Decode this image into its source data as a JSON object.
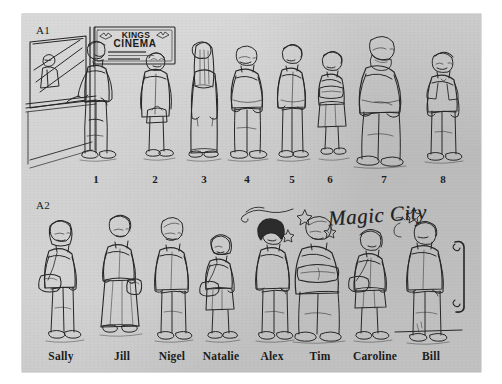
{
  "figure": {
    "panels": [
      {
        "id": "A1",
        "label": "A1",
        "caption_type": "numbers",
        "signage": {
          "line1": "KINGS",
          "line2": "CINEMA"
        },
        "items": [
          {
            "label": "1",
            "description": "bearded man at ticket window"
          },
          {
            "label": "2",
            "description": "short elderly woman with handbag"
          },
          {
            "label": "3",
            "description": "tall woman with long hair and long dress"
          },
          {
            "label": "4",
            "description": "bald heavyset man"
          },
          {
            "label": "5",
            "description": "woman in jacket and trousers"
          },
          {
            "label": "6",
            "description": "short woman in skirt, arms folded"
          },
          {
            "label": "7",
            "description": "large bald bearded man"
          },
          {
            "label": "8",
            "description": "man with glasses in t-shirt"
          }
        ]
      },
      {
        "id": "A2",
        "label": "A2",
        "caption_type": "names",
        "signage": {
          "title": "Magic City"
        },
        "items": [
          {
            "label": "Sally",
            "description": "woman with glasses and shoulder bag"
          },
          {
            "label": "Jill",
            "description": "woman with glasses in long skirt holding bag"
          },
          {
            "label": "Nigel",
            "description": "bald man in jacket and trousers"
          },
          {
            "label": "Natalie",
            "description": "girl with shoulder bag and skirt"
          },
          {
            "label": "Alex",
            "description": "person with dark curly hair"
          },
          {
            "label": "Tim",
            "description": "heavyset bald man, arms folded"
          },
          {
            "label": "Caroline",
            "description": "woman with shoulder bag and short skirt"
          },
          {
            "label": "Bill",
            "description": "tall man facing a door"
          }
        ]
      }
    ],
    "number_positions": [
      96,
      155,
      204,
      247,
      292,
      330,
      384,
      443
    ],
    "name_positions": [
      61,
      122,
      172,
      221,
      272,
      320,
      375,
      431
    ]
  },
  "colors": {
    "page": "#ffffff",
    "panel": "#c9c9c9",
    "ink": "#1b1b1b"
  }
}
